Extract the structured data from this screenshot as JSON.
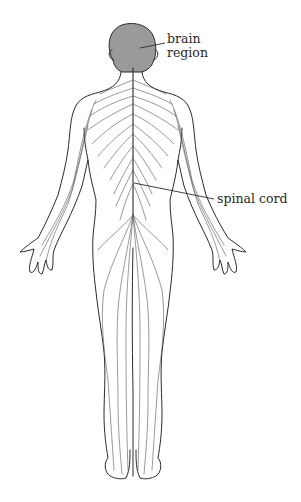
{
  "diagram": {
    "labels": [
      {
        "id": "brain",
        "text_line1": "brain",
        "text_line2": "region"
      },
      {
        "id": "spinal",
        "text": "spinal cord"
      }
    ],
    "colors": {
      "brain_fill": "#9a9a9a",
      "outline": "#2b2b2b",
      "nerves": "#555555",
      "background": "#ffffff"
    }
  }
}
